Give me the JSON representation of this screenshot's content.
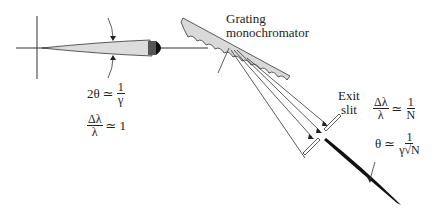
{
  "labels": {
    "grating_line1": "Grating",
    "grating_line2": "monochromator",
    "exit_line1": "Exit",
    "exit_line2": "slit"
  },
  "equations": {
    "undulator_angle": {
      "lhs": "2θ",
      "op": "≃",
      "num": "1",
      "den": "γ"
    },
    "undulator_bandwidth": {
      "num": "Δλ",
      "den": "λ",
      "op": "≃",
      "rhs": "1"
    },
    "mono_bandwidth": {
      "num": "Δλ",
      "den": "λ",
      "op": "≃",
      "rhs_num": "1",
      "rhs_den": "N"
    },
    "mono_angle": {
      "lhs": "θ",
      "op": "≃",
      "num": "1",
      "den": "γ√N"
    }
  },
  "colors": {
    "stroke": "#333333",
    "grating_fill": "#d9d9d9",
    "beam_fill": "#dcdcdc",
    "dark_beam": "#111111"
  }
}
